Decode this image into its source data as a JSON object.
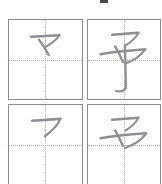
{
  "page": {
    "kind": "character-stroke-order-practice-grid",
    "background_color": "#ffffff",
    "grid_line_color": "#8c8c8c",
    "guide_line_color": "#c9a0a0",
    "stroke_color": "#8e8e93",
    "rows": 2,
    "columns": 2,
    "cut_off_edges": "right-and-bottom"
  },
  "top_marker": {
    "label": "",
    "color": "#4a4a4a"
  },
  "cells": [
    {
      "id": "cell-1",
      "position": "row-1-col-1",
      "character": "マ",
      "stroke_count_shown": 2,
      "description": "two strokes: horizontal-turn and descending diagonal"
    },
    {
      "id": "cell-2",
      "position": "row-1-col-2",
      "character": "予",
      "stroke_count_shown": 4,
      "description": "complete character with long vertical hook"
    },
    {
      "id": "cell-3",
      "position": "row-2-col-1",
      "character": "フ",
      "stroke_count_shown": 1,
      "description": "single horizontal-turn stroke"
    },
    {
      "id": "cell-4",
      "position": "row-2-col-2",
      "character": "マ",
      "stroke_count_shown": 3,
      "description": "partial character, horizontal stroke through and turn"
    }
  ]
}
